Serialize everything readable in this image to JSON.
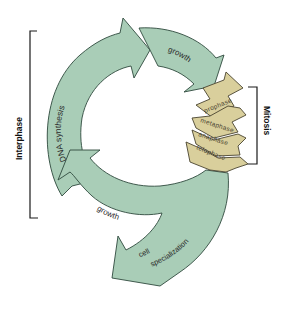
{
  "diagram": {
    "colors": {
      "interphase_fill": "#a9cdb7",
      "mitosis_fill": "#d9cf9c",
      "outline": "#2f4a3d",
      "background": "#ffffff"
    },
    "groups": {
      "interphase": "Interphase",
      "mitosis": "Mitosis"
    },
    "interphase_stages": [
      {
        "label": "DNA synthesis"
      },
      {
        "label": "growth"
      },
      {
        "label": "growth"
      }
    ],
    "mitosis_stages": [
      {
        "label": "prophase"
      },
      {
        "label": "metaphase"
      },
      {
        "label": "anaphase"
      },
      {
        "label": "telophase"
      }
    ],
    "exit_arrow": {
      "line1": "cell",
      "line2": "specialization"
    }
  }
}
